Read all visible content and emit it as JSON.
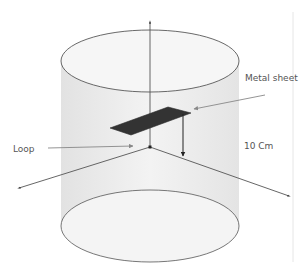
{
  "labels": {
    "metal_sheet": "Metal sheet",
    "loop": "Loop",
    "distance": "10 Cm"
  },
  "colors": {
    "cylinder_fill": "#ececec",
    "cylinder_edge": "#555555",
    "ellipse_fill": "#f4f4f4",
    "metal_sheet": "#333333",
    "axis": "#555555",
    "arrow": "#777777"
  },
  "shapes": {
    "cylinder": {
      "cx": 150,
      "top_cy": 61,
      "bottom_cy": 226,
      "rx": 89,
      "top_ry": 31,
      "bottom_ry": 36
    },
    "z_axis": {
      "x": 150,
      "y_top": 20,
      "y_origin": 147
    },
    "x_axis_left_end": [
      18,
      188
    ],
    "y_axis_right_end": [
      290,
      196
    ],
    "metal_sheet_points": "110,128 168,107 191,113 131,135",
    "height_arrow": {
      "x": 183,
      "y_top": 114,
      "y_bottom": 156
    }
  }
}
